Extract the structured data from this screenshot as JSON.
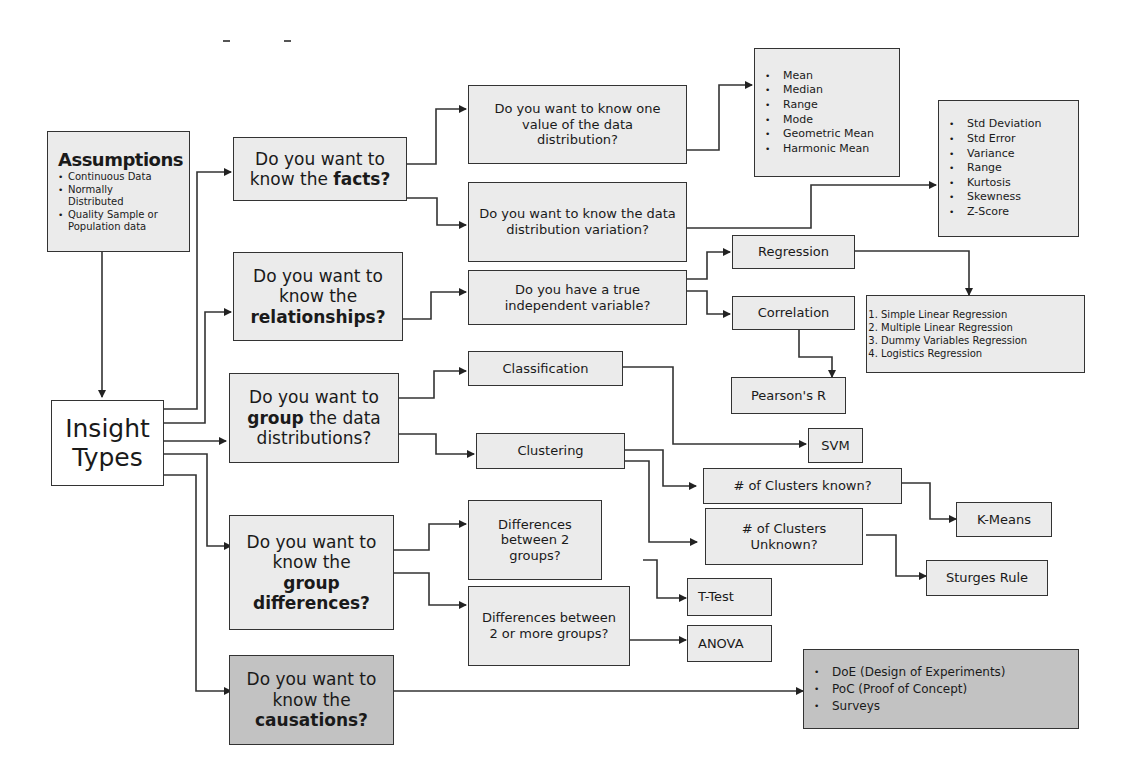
{
  "diagram": {
    "root": {
      "line1": "Insight",
      "line2": "Types"
    },
    "assumptions": {
      "title": "Assumptions",
      "items": [
        "Continuous Data",
        "Normally Distributed",
        "Quality Sample or Population data"
      ]
    },
    "questions": {
      "facts": {
        "pre": "Do you want to know the ",
        "em": "facts?"
      },
      "relationships": {
        "pre": "Do you want to know the",
        "em": "relationships?"
      },
      "group": {
        "pre": "Do you want to",
        "em": "group",
        "post": "the data distributions?"
      },
      "differences": {
        "pre": "Do you want to know the",
        "em": "group differences?"
      },
      "causations": {
        "pre": "Do you want to know the",
        "em": "causations?"
      }
    },
    "sub_questions": {
      "one_value": "Do you want to know one value of the data distribution?",
      "variation": "Do you want to know the data distribution variation?",
      "independent": "Do you have a true independent variable?",
      "classification": "Classification",
      "clustering": "Clustering",
      "clusters_known": "# of Clusters known?",
      "clusters_unknown": "# of Clusters Unknown?",
      "diff_2": "Differences between 2 groups?",
      "diff_2_more": "Differences between 2 or more groups?",
      "regression": "Regression",
      "correlation": "Correlation"
    },
    "outcomes": {
      "central_tendency": [
        "Mean",
        "Median",
        "Range",
        "Mode",
        "Geometric Mean",
        "Harmonic Mean"
      ],
      "dispersion": [
        "Std Deviation",
        "Std Error",
        "Variance",
        "Range",
        "Kurtosis",
        "Skewness",
        "Z-Score"
      ],
      "regression_types": [
        "Simple Linear Regression",
        "Multiple Linear Regression",
        "Dummy Variables Regression",
        "Logistics Regression"
      ],
      "pearson": "Pearson's R",
      "svm": "SVM",
      "kmeans": "K-Means",
      "sturges": "Sturges Rule",
      "ttest": "T-Test",
      "anova": "ANOVA",
      "causation_methods": [
        "DoE (Design of Experiments)",
        "PoC (Proof of Concept)",
        "Surveys"
      ]
    },
    "colors": {
      "box_fill": "#ebebeb",
      "box_dark": "#c2c2c2",
      "border": "#333333",
      "background": "#ffffff"
    }
  }
}
